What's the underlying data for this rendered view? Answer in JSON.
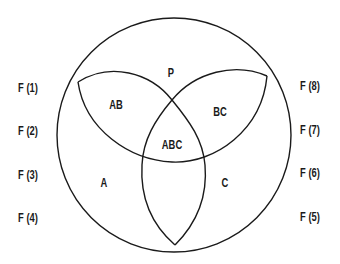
{
  "diagram": {
    "type": "venn-in-circle",
    "outer_region_label": "P",
    "regions": [
      {
        "id": "AB",
        "label": "AB",
        "x": 116,
        "y": 105
      },
      {
        "id": "BC",
        "label": "BC",
        "x": 220,
        "y": 112
      },
      {
        "id": "ABC",
        "label": "ABC",
        "x": 172,
        "y": 145
      },
      {
        "id": "A",
        "label": "A",
        "x": 104,
        "y": 183
      },
      {
        "id": "C",
        "label": "C",
        "x": 225,
        "y": 183
      },
      {
        "id": "P",
        "label": "P",
        "x": 171,
        "y": 73
      }
    ],
    "left_labels": [
      {
        "label": "F (1)",
        "x": 28,
        "y": 88
      },
      {
        "label": "F (2)",
        "x": 28,
        "y": 131
      },
      {
        "label": "F (3)",
        "x": 28,
        "y": 175
      },
      {
        "label": "F (4)",
        "x": 28,
        "y": 218
      }
    ],
    "right_labels": [
      {
        "label": "F (8)",
        "x": 310,
        "y": 86
      },
      {
        "label": "F (7)",
        "x": 310,
        "y": 130
      },
      {
        "label": "F (6)",
        "x": 310,
        "y": 173
      },
      {
        "label": "F (5)",
        "x": 310,
        "y": 217
      }
    ],
    "colors": {
      "stroke": "#1a1a1a",
      "text": "#1a1a1a",
      "background": "#ffffff"
    }
  }
}
